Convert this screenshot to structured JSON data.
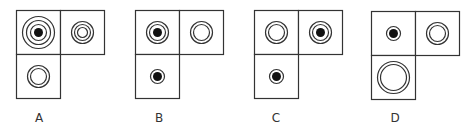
{
  "figure": {
    "stroke_color": "#333333",
    "fill_color": "#111111",
    "background": "#ffffff",
    "cell_size": 44,
    "options": [
      {
        "label": "A",
        "origin": [
          16,
          10
        ],
        "label_x": 39,
        "cells": [
          {
            "position": "top-left",
            "rings": [
              16,
              12,
              8
            ],
            "dot": 4.5
          },
          {
            "position": "top-right",
            "rings": [
              11,
              8,
              5
            ],
            "dot": 0
          },
          {
            "position": "bottom-left",
            "rings": [
              11,
              8
            ],
            "dot": 0
          }
        ]
      },
      {
        "label": "B",
        "origin": [
          135,
          10
        ],
        "label_x": 159,
        "cells": [
          {
            "position": "top-left",
            "rings": [
              11,
              8
            ],
            "dot": 4.5
          },
          {
            "position": "top-right",
            "rings": [
              11,
              8
            ],
            "dot": 0
          },
          {
            "position": "bottom-left",
            "rings": [
              7
            ],
            "dot": 4.5
          }
        ]
      },
      {
        "label": "C",
        "origin": [
          254,
          10
        ],
        "label_x": 276,
        "cells": [
          {
            "position": "top-left",
            "rings": [
              11,
              8
            ],
            "dot": 0
          },
          {
            "position": "top-right",
            "rings": [
              11,
              8
            ],
            "dot": 4.5
          },
          {
            "position": "bottom-left",
            "rings": [
              7
            ],
            "dot": 4.5
          }
        ]
      },
      {
        "label": "D",
        "origin": [
          371,
          11
        ],
        "label_x": 395,
        "cells": [
          {
            "position": "top-left",
            "rings": [
              7
            ],
            "dot": 4.5
          },
          {
            "position": "top-right",
            "rings": [
              11,
              8
            ],
            "dot": 0
          },
          {
            "position": "bottom-left",
            "rings": [
              16,
              13
            ],
            "dot": 0
          }
        ]
      }
    ]
  }
}
